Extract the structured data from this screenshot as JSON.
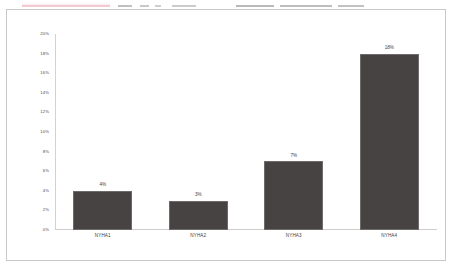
{
  "chart_data": {
    "type": "bar",
    "title": "",
    "subtitle": "",
    "xlabel": "",
    "ylabel": "",
    "categories": [
      "NYHA1",
      "NYHA2",
      "NYHA3",
      "NYHA4"
    ],
    "values": [
      4,
      3,
      7,
      18
    ],
    "value_labels": [
      "4%",
      "3%",
      "7%",
      "18%"
    ],
    "ylim": [
      0,
      20
    ],
    "ytick_values": [
      0,
      2,
      4,
      6,
      8,
      10,
      12,
      14,
      16,
      18,
      20
    ],
    "ytick_labels": [
      "0%",
      "2%",
      "4%",
      "6%",
      "8%",
      "10%",
      "12%",
      "14%",
      "16%",
      "18%",
      "20%"
    ],
    "grid": false,
    "legend": false,
    "legend_position": "none",
    "bar_color": "#474342",
    "bar_border_color": "#6e6a69",
    "axis_color": "#cdcdcd",
    "text_color": "#3d3d3d",
    "plot_background": "#ffffff",
    "frame_border_color": "#c9c9c9"
  },
  "page": {
    "background": "#ffffff",
    "accent": "#e8a0ae"
  }
}
